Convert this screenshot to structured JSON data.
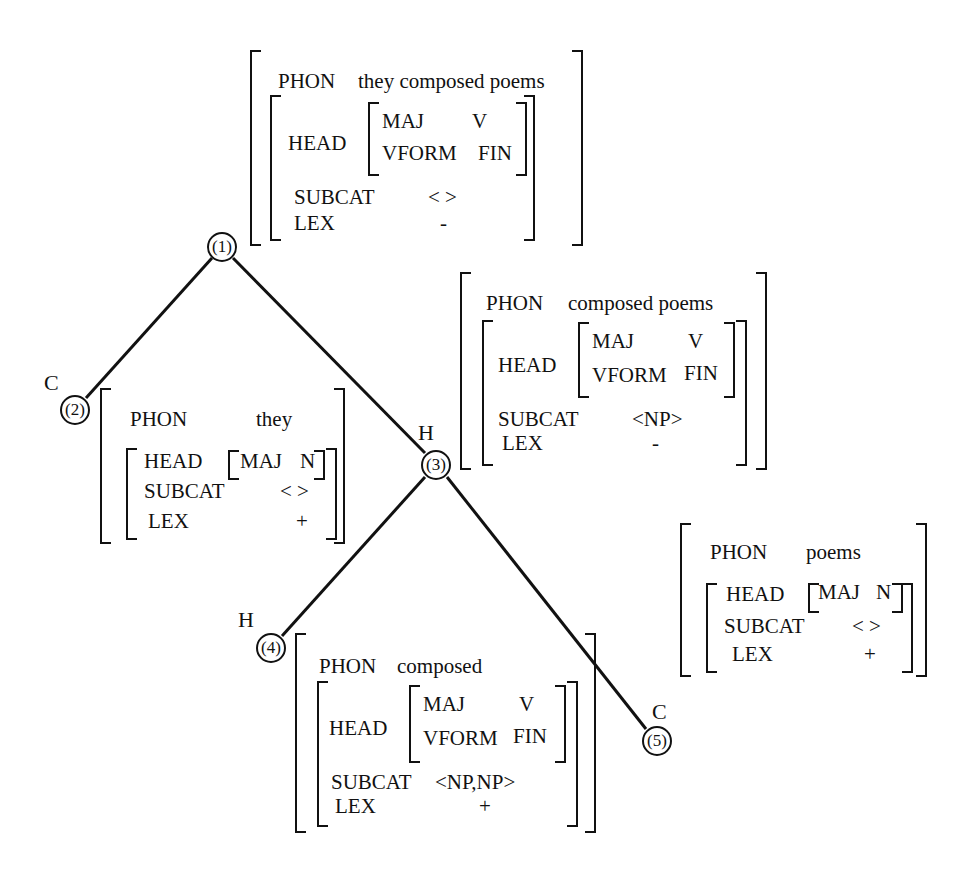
{
  "diagram": {
    "type": "feature-structure-tree",
    "nodes": [
      {
        "id": "1",
        "label": "(1)",
        "role": "",
        "phon": "they composed poems",
        "head": {
          "MAJ": "V",
          "VFORM": "FIN"
        },
        "subcat": "< >",
        "lex": "-"
      },
      {
        "id": "2",
        "label": "(2)",
        "role": "C",
        "phon": "they",
        "head": {
          "MAJ": "N"
        },
        "subcat": "< >",
        "lex": "+"
      },
      {
        "id": "3",
        "label": "(3)",
        "role": "H",
        "phon": "composed poems",
        "head": {
          "MAJ": "V",
          "VFORM": "FIN"
        },
        "subcat": "<NP>",
        "lex": "-"
      },
      {
        "id": "4",
        "label": "(4)",
        "role": "H",
        "phon": "composed",
        "head": {
          "MAJ": "V",
          "VFORM": "FIN"
        },
        "subcat": "<NP,NP>",
        "lex": "+"
      },
      {
        "id": "5",
        "label": "(5)",
        "role": "C",
        "phon": "poems",
        "head": {
          "MAJ": "N"
        },
        "subcat": "< >",
        "lex": "+"
      }
    ],
    "edges": [
      [
        "1",
        "2"
      ],
      [
        "1",
        "3"
      ],
      [
        "3",
        "4"
      ],
      [
        "3",
        "5"
      ]
    ],
    "features": {
      "phon": "PHON",
      "head": "HEAD",
      "subcat": "SUBCAT",
      "lex": "LEX",
      "maj": "MAJ",
      "vform": "VFORM"
    }
  }
}
